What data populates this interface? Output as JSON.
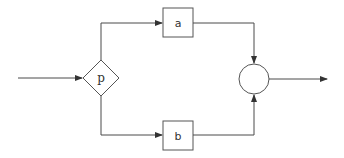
{
  "diagram": {
    "type": "flow-diagram",
    "nodes": [
      {
        "id": "p",
        "shape": "diamond",
        "label": "p"
      },
      {
        "id": "a",
        "shape": "box",
        "label": "a"
      },
      {
        "id": "b",
        "shape": "box",
        "label": "b"
      },
      {
        "id": "join",
        "shape": "circle",
        "label": ""
      }
    ],
    "edges": [
      {
        "from": "input",
        "to": "p"
      },
      {
        "from": "p",
        "to": "a"
      },
      {
        "from": "p",
        "to": "b"
      },
      {
        "from": "a",
        "to": "join"
      },
      {
        "from": "b",
        "to": "join"
      },
      {
        "from": "join",
        "to": "output"
      }
    ],
    "colors": {
      "line": "#4a4a4a",
      "background": "#ffffff"
    }
  }
}
